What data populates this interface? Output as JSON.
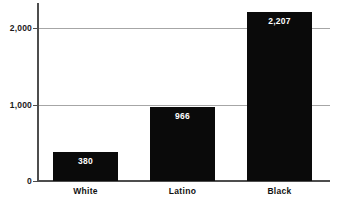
{
  "chart_data": {
    "type": "bar",
    "title": "",
    "subtitle": "",
    "xlabel": "",
    "ylabel": "",
    "categories": [
      "White",
      "Latino",
      "Black"
    ],
    "values": [
      380,
      966,
      2207
    ],
    "value_labels": [
      "380",
      "966",
      "2,207"
    ],
    "ylim": [
      0,
      2300
    ],
    "yticks": [
      0,
      1000,
      2000
    ],
    "ytick_labels": [
      "0",
      "1,000",
      "2,000"
    ],
    "grid": "horizontal",
    "legend": "none",
    "series": [
      {
        "name": "",
        "values": [
          380,
          966,
          2207
        ]
      }
    ],
    "colors": {
      "bar": "#0a0a0a",
      "background": "#ffffff",
      "gridline": "#a6a6a6",
      "axis": "#4d4d4d",
      "value_label": "#ffffff",
      "category_label": "#111111",
      "tick_label": "#1a1a1a"
    }
  }
}
